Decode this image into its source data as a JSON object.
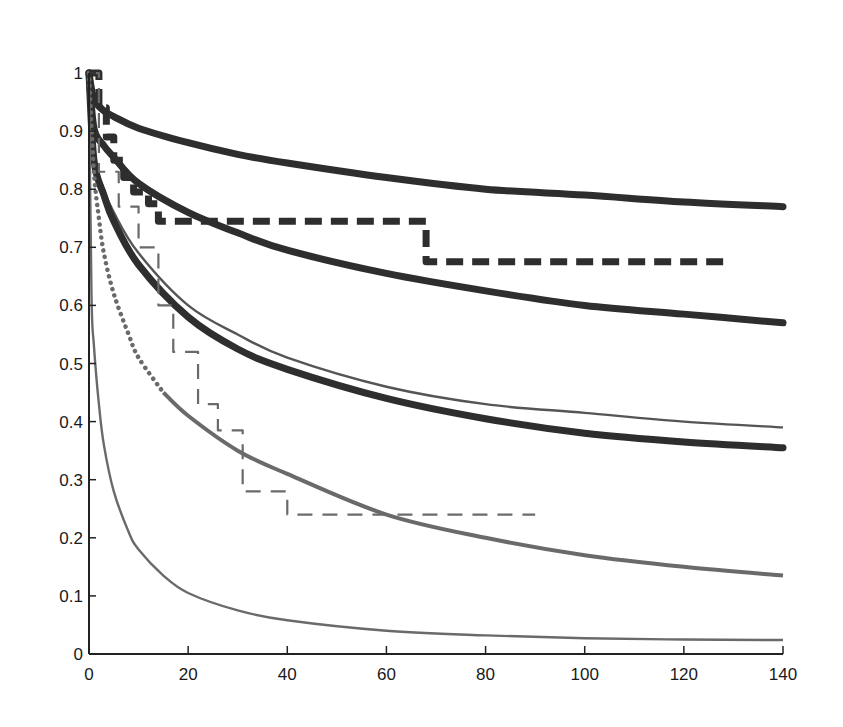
{
  "chart_data": {
    "type": "line",
    "title": "",
    "xlabel": "",
    "ylabel": "",
    "xlim": [
      0,
      140
    ],
    "ylim": [
      0,
      1
    ],
    "grid": false,
    "legend": null,
    "x_ticks": [
      "0",
      "20",
      "40",
      "60",
      "80",
      "100",
      "120",
      "140"
    ],
    "y_ticks": [
      "0",
      "0.1",
      "0.2",
      "0.3",
      "0.4",
      "0.5",
      "0.6",
      "0.7",
      "0.8",
      "0.9",
      "1"
    ],
    "series": [
      {
        "name": "thick-curve-top",
        "style": "solid-thick",
        "color": "#2e2e2e",
        "x": [
          0,
          1,
          3,
          5,
          10,
          20,
          30,
          40,
          60,
          80,
          100,
          120,
          140
        ],
        "y": [
          1.0,
          0.955,
          0.935,
          0.925,
          0.905,
          0.88,
          0.86,
          0.845,
          0.82,
          0.8,
          0.79,
          0.778,
          0.77
        ]
      },
      {
        "name": "thick-curve-second",
        "style": "solid-thick",
        "color": "#2e2e2e",
        "x": [
          0,
          1,
          3,
          5,
          10,
          20,
          30,
          40,
          60,
          80,
          100,
          120,
          140
        ],
        "y": [
          1.0,
          0.905,
          0.875,
          0.855,
          0.81,
          0.76,
          0.725,
          0.695,
          0.655,
          0.625,
          0.6,
          0.585,
          0.57
        ]
      },
      {
        "name": "thin-gray-curve",
        "style": "solid-thin",
        "color": "#555555",
        "x": [
          0,
          1,
          3,
          5,
          10,
          20,
          30,
          40,
          60,
          80,
          100,
          120,
          140
        ],
        "y": [
          1.0,
          0.86,
          0.8,
          0.76,
          0.69,
          0.6,
          0.55,
          0.51,
          0.46,
          0.43,
          0.415,
          0.4,
          0.39
        ]
      },
      {
        "name": "thick-curve-third",
        "style": "solid-thick",
        "color": "#2e2e2e",
        "x": [
          0,
          1,
          3,
          5,
          10,
          20,
          30,
          40,
          60,
          80,
          100,
          120,
          140
        ],
        "y": [
          1.0,
          0.85,
          0.79,
          0.745,
          0.67,
          0.58,
          0.525,
          0.49,
          0.44,
          0.405,
          0.38,
          0.365,
          0.355
        ]
      },
      {
        "name": "medium-gray-curve-dotted-start",
        "style": "dotted-then-solid",
        "color": "#6a6a6a",
        "x": [
          0,
          1,
          2,
          3,
          5,
          8,
          10,
          15,
          20,
          30,
          40,
          60,
          80,
          100,
          120,
          140
        ],
        "y": [
          1.0,
          0.83,
          0.75,
          0.69,
          0.62,
          0.55,
          0.51,
          0.45,
          0.41,
          0.35,
          0.31,
          0.24,
          0.2,
          0.17,
          0.15,
          0.135
        ]
      },
      {
        "name": "thin-bottom-curve",
        "style": "solid-thin",
        "color": "#6a6a6a",
        "x": [
          0,
          0.5,
          1,
          2,
          3,
          5,
          8,
          10,
          15,
          20,
          30,
          40,
          60,
          80,
          100,
          120,
          140
        ],
        "y": [
          1.0,
          0.62,
          0.53,
          0.43,
          0.36,
          0.28,
          0.21,
          0.18,
          0.135,
          0.105,
          0.075,
          0.058,
          0.04,
          0.032,
          0.027,
          0.025,
          0.024
        ]
      },
      {
        "name": "thick-dashed-step",
        "style": "dashed-thick-step",
        "color": "#2e2e2e",
        "x": [
          0,
          2,
          2,
          3.5,
          3.5,
          5,
          5,
          7,
          7,
          9,
          9,
          12,
          12,
          14,
          14,
          68,
          68,
          128
        ],
        "y": [
          1.0,
          1.0,
          0.94,
          0.94,
          0.89,
          0.89,
          0.85,
          0.85,
          0.82,
          0.82,
          0.795,
          0.795,
          0.775,
          0.775,
          0.745,
          0.745,
          0.675,
          0.675
        ]
      },
      {
        "name": "thin-dashed-step",
        "style": "dashed-thin-step",
        "color": "#6a6a6a",
        "x": [
          0,
          2,
          2,
          6,
          6,
          10,
          10,
          14,
          14,
          17,
          17,
          22,
          22,
          26,
          26,
          31,
          31,
          35,
          35,
          40,
          40,
          90
        ],
        "y": [
          1.0,
          1.0,
          0.83,
          0.83,
          0.77,
          0.77,
          0.7,
          0.7,
          0.6,
          0.6,
          0.52,
          0.52,
          0.43,
          0.43,
          0.385,
          0.385,
          0.28,
          0.28,
          0.28,
          0.28,
          0.24,
          0.24
        ]
      }
    ]
  }
}
